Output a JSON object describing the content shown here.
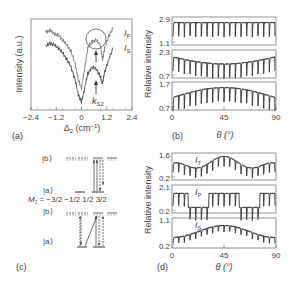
{
  "figure": {
    "panels": {
      "a": {
        "label": "(a)"
      },
      "b": {
        "label": "(b)"
      },
      "c": {
        "label": "(c)"
      },
      "d": {
        "label": "(d)"
      }
    }
  },
  "chart_data": [
    {
      "id": "a",
      "type": "line",
      "title": "",
      "xlabel": "Δ2 (cm⁻¹)",
      "ylabel": "Intensity (a.u.)",
      "xlim": [
        -2.4,
        2.4
      ],
      "xticks": [
        "-2.4",
        "-1.2",
        "0",
        "1.2",
        "2.4"
      ],
      "grid": false,
      "series": [
        {
          "name": "I_P",
          "x": [
            -1.7,
            -1.5,
            -1.3,
            -1.1,
            -0.9,
            -0.7,
            -0.5,
            -0.3,
            -0.15,
            0,
            0.15,
            0.3,
            0.5,
            0.7,
            0.9,
            1.0,
            1.1,
            1.3,
            1.5
          ],
          "y": [
            0.9,
            0.92,
            0.88,
            0.86,
            0.8,
            0.74,
            0.66,
            0.5,
            0.3,
            0.2,
            0.45,
            0.7,
            0.78,
            0.8,
            0.74,
            0.55,
            0.7,
            0.85,
            0.95
          ]
        },
        {
          "name": "I_S",
          "x": [
            -1.7,
            -1.5,
            -1.3,
            -1.1,
            -0.9,
            -0.7,
            -0.5,
            -0.3,
            -0.15,
            0,
            0.15,
            0.3,
            0.5,
            0.7,
            0.9,
            1.0,
            1.1,
            1.3,
            1.5
          ],
          "y": [
            0.72,
            0.76,
            0.74,
            0.7,
            0.64,
            0.56,
            0.46,
            0.3,
            0.12,
            0.02,
            0.2,
            0.38,
            0.46,
            0.44,
            0.34,
            0.26,
            0.4,
            0.56,
            0.7
          ]
        }
      ],
      "annotations": [
        "I_P",
        "I_S",
        "k_S2",
        "circle around I_P central peak",
        "upward arrows at Δ2≈0.6"
      ]
    },
    {
      "id": "b",
      "type": "line",
      "xlabel": "θ (°)",
      "ylabel": "Relative intensity",
      "xlim": [
        0,
        90
      ],
      "xticks": [
        "0",
        "45",
        "90"
      ],
      "subplots": [
        {
          "ylim": [
            1.1,
            2.9
          ],
          "yticks": [
            "2.9",
            "1.1"
          ],
          "description": "regular periodic dips, ~18 dips over 0–90°, flat envelope ~2.5"
        },
        {
          "ylim": [
            0.7,
            2.3
          ],
          "yticks": [
            "2.3",
            "0.7"
          ],
          "description": "periodic dips with envelope minimum near θ≈45°"
        },
        {
          "ylim": [
            0.7,
            1.7
          ],
          "yticks": [
            "1.7",
            "0.7"
          ],
          "description": "periodic dips with envelope maximum near θ≈45°"
        }
      ]
    },
    {
      "id": "c",
      "type": "diagram",
      "title": "Energy level scheme",
      "labels": [
        "|b⟩",
        "|a⟩",
        "M_J = −3/2  −1/2  1/2  3/2",
        "|b⟩",
        "|a⟩"
      ]
    },
    {
      "id": "d",
      "type": "line",
      "xlabel": "θ (°)",
      "ylabel": "Relative intensity",
      "xlim": [
        0,
        90
      ],
      "xticks": [
        "0",
        "45",
        "90"
      ],
      "subplots": [
        {
          "name": "I_T",
          "ylim": [
            0.2,
            1.6
          ],
          "yticks": [
            "1.6",
            "0.2"
          ],
          "description": "oscillations with envelope max near 45°, min near 20° and 70°"
        },
        {
          "name": "I_P",
          "ylim": [
            0.2,
            2.1
          ],
          "yticks": [
            "2.1",
            "0.2"
          ],
          "description": "strong oscillations near 0°, 45°, 90°; low flat near 22° and 68°"
        },
        {
          "name": "I_S",
          "ylim": [
            0.2,
            1.1
          ],
          "yticks": [
            "1.1",
            "0.2"
          ],
          "description": "broad peak near 45°"
        }
      ]
    }
  ],
  "text": {
    "a_ylabel": "Intensity (a.u.)",
    "a_xlabel": "Δ",
    "a_xlabel_sub": "2",
    "a_xlabel_unit": " (cm",
    "a_xlabel_sup": "−1",
    "a_xlabel_close": ")",
    "a_xticks": [
      "−2.4",
      "−1.2",
      "0",
      "1.2",
      "2.4"
    ],
    "a_IP": "I",
    "a_IP_sub": "P",
    "a_IS": "I",
    "a_IS_sub": "S",
    "a_k": "k",
    "a_k_sub": "S2",
    "b_ylabel": "Relative intensity",
    "b_yticks": [
      [
        "2.9",
        "1.1"
      ],
      [
        "2.3",
        "0.7"
      ],
      [
        "1.7",
        "0.7"
      ]
    ],
    "theta_label": "θ (°)",
    "xticks_theta": [
      "0",
      "45",
      "90"
    ],
    "d_ylabel": "Relative intensity",
    "d_yticks": [
      [
        "1.6",
        "0.2"
      ],
      [
        "2.1",
        "0.2"
      ],
      [
        "1.1",
        "0.2"
      ]
    ],
    "d_names": [
      [
        "I",
        "T"
      ],
      [
        "I",
        "P"
      ],
      [
        "I",
        "S"
      ]
    ],
    "c_b": "|b⟩",
    "c_a": "|a⟩",
    "c_mj": "M",
    "c_mj_sub": "J",
    "c_mj_vals": " = −3/2  −1/2  1/2  3/2"
  }
}
